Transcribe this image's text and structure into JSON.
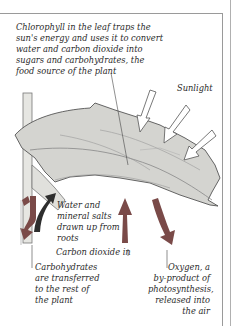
{
  "diagram": {
    "labels": {
      "chlorophyll": "Chlorophyll in the leaf traps the\nsun's energy and uses it to convert\nwater and carbon dioxide into\nsugars and carbohydrates, the\nfood source of the plant",
      "sunlight": "Sunlight",
      "water": "Water and\nmineral salts\ndrawn up from\nroots",
      "carbon_dioxide": "Carbon dioxide in",
      "carbohydrates": "Carbohydrates\nare transferred\nto the rest of\nthe plant",
      "oxygen": "Oxygen, a\nby-product of\nphotosynthesis,\nreleased into\nthe air"
    },
    "colors": {
      "leaf_fill": "#d4d4d0",
      "leaf_stroke": "#555555",
      "arrow_red": "#7a4a48",
      "arrow_dark": "#2e2e2e",
      "sun_arrow_fill": "#ffffff",
      "text": "#2a2a2a"
    }
  }
}
